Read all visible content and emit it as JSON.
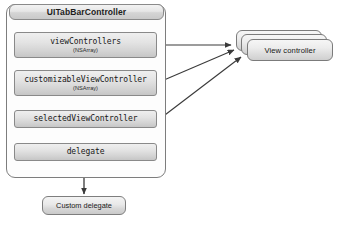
{
  "diagram": {
    "controller": {
      "name": "UITabBarController",
      "properties": [
        {
          "name": "viewControllers",
          "type": "(NSArray)"
        },
        {
          "name": "customizableViewController",
          "type": "(NSArray)"
        },
        {
          "name": "selectedViewController",
          "type": ""
        },
        {
          "name": "delegate",
          "type": ""
        }
      ]
    },
    "nodes": {
      "view_controller_stack": {
        "label": "View controller",
        "stack_count": 3
      },
      "custom_delegate": {
        "label": "Custom delegate"
      }
    },
    "connections": [
      {
        "from": "viewControllers",
        "to": "View controller",
        "style": "arrow"
      },
      {
        "from": "customizableViewController",
        "to": "View controller",
        "style": "arrow"
      },
      {
        "from": "selectedViewController",
        "to": "View controller",
        "style": "arrow"
      },
      {
        "from": "delegate",
        "to": "Custom delegate",
        "style": "arrow"
      }
    ],
    "colors": {
      "border": "#7d7d7d",
      "box_fill_top": "#efefef",
      "box_fill_bottom": "#c6c6c6",
      "canvas": "#ffffff",
      "arrow": "#3a3a3a",
      "text": "#171717"
    }
  }
}
